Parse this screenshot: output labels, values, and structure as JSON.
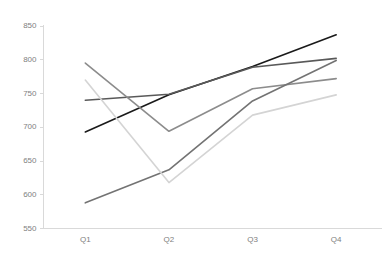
{
  "chart_data": {
    "type": "line",
    "title": "",
    "subtitle": "",
    "xlabel": "",
    "ylabel": "",
    "categories": [
      "Q1",
      "Q2",
      "Q3",
      "Q4"
    ],
    "ylim": [
      550,
      850
    ],
    "yticks": [
      550,
      600,
      650,
      700,
      750,
      800,
      850
    ],
    "ytick_labels": [
      "550",
      "600",
      "650",
      "700",
      "750",
      "800",
      "850"
    ],
    "xtick_labels": [
      "Q1",
      "Q2",
      "Q3",
      "Q4"
    ],
    "grid": false,
    "legend": "none",
    "series": [
      {
        "name": "series-1",
        "color": "#1a1a1a",
        "values": [
          693,
          748,
          790,
          837
        ]
      },
      {
        "name": "series-2",
        "color": "#595959",
        "values": [
          740,
          749,
          789,
          802
        ]
      },
      {
        "name": "series-3",
        "color": "#8c8c8c",
        "values": [
          795,
          694,
          757,
          772
        ]
      },
      {
        "name": "series-4",
        "color": "#737373",
        "values": [
          588,
          637,
          739,
          799
        ]
      },
      {
        "name": "series-5",
        "color": "#d4d4d4",
        "values": [
          770,
          618,
          718,
          748
        ]
      }
    ],
    "axis_color": "#d9d9d9",
    "tick_label_color": "#808080",
    "background_color": "#ffffff"
  }
}
